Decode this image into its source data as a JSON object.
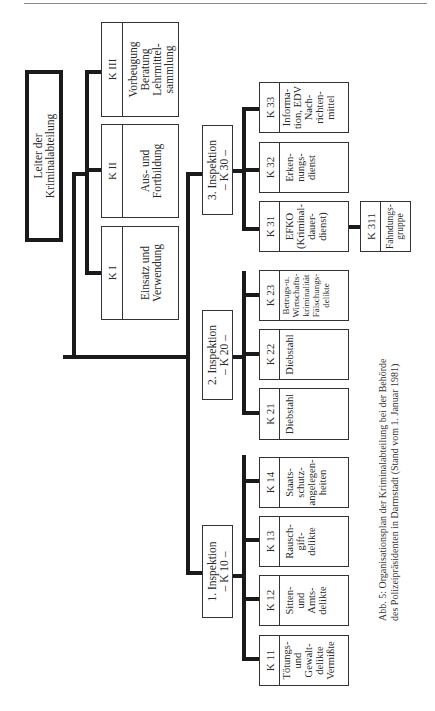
{
  "page": {
    "caption": "Abb. 5: Organisationsplan der Kriminalabteilung bei der Behörde\n des Polizeipräsidenten in Darmstadt (Stand vom 1. Januar 1981)"
  },
  "diagram": {
    "root": "Leiter der\nKriminalabteilung",
    "staff_units": [
      {
        "code": "K I",
        "label": "Einsatz und\nVerwendung"
      },
      {
        "code": "K II",
        "label": "Aus- und\nFortbildung"
      },
      {
        "code": "K III",
        "label": "Vorbeugung\nBeratung\nLehrmittel-\nsammlung"
      }
    ],
    "inspections": [
      {
        "label": "1. Inspektion\n– K 10 –",
        "units": [
          {
            "code": "K 11",
            "label": "Tötungs-\nund\nGewalt-\ndelikte\nVermißte"
          },
          {
            "code": "K 12",
            "label": "Sitten-\nund\nAmts-\ndelikte"
          },
          {
            "code": "K 13",
            "label": "Rausch-\ngift-\ndelikte"
          },
          {
            "code": "K 14",
            "label": "Staats-\nschutz-\nangelegen-\nheiten"
          }
        ]
      },
      {
        "label": "2. Inspektion\n– K 20 –",
        "units": [
          {
            "code": "K 21",
            "label": "Diebstahl"
          },
          {
            "code": "K 22",
            "label": "Diebstahl"
          },
          {
            "code": "K 23",
            "label": "Betrugs-u.\nWirtschafts-\nkriminalität\nFälschungs-\ndelikte"
          }
        ]
      },
      {
        "label": "3. Inspektion\n– K 30 –",
        "units": [
          {
            "code": "K 31",
            "label": "EFKO\n(Kriminal-\ndauer-\ndienst)"
          },
          {
            "code": "K 32",
            "label": "Erken-\nnungs-\ndienst"
          },
          {
            "code": "K 33",
            "label": "Informa-\ntion, EDV\nNach-\nrichten-\nmittel"
          }
        ],
        "sub_unit": {
          "parent": "K 31",
          "code": "K 311",
          "label": "Fahndungs-\ngruppe"
        }
      }
    ]
  }
}
